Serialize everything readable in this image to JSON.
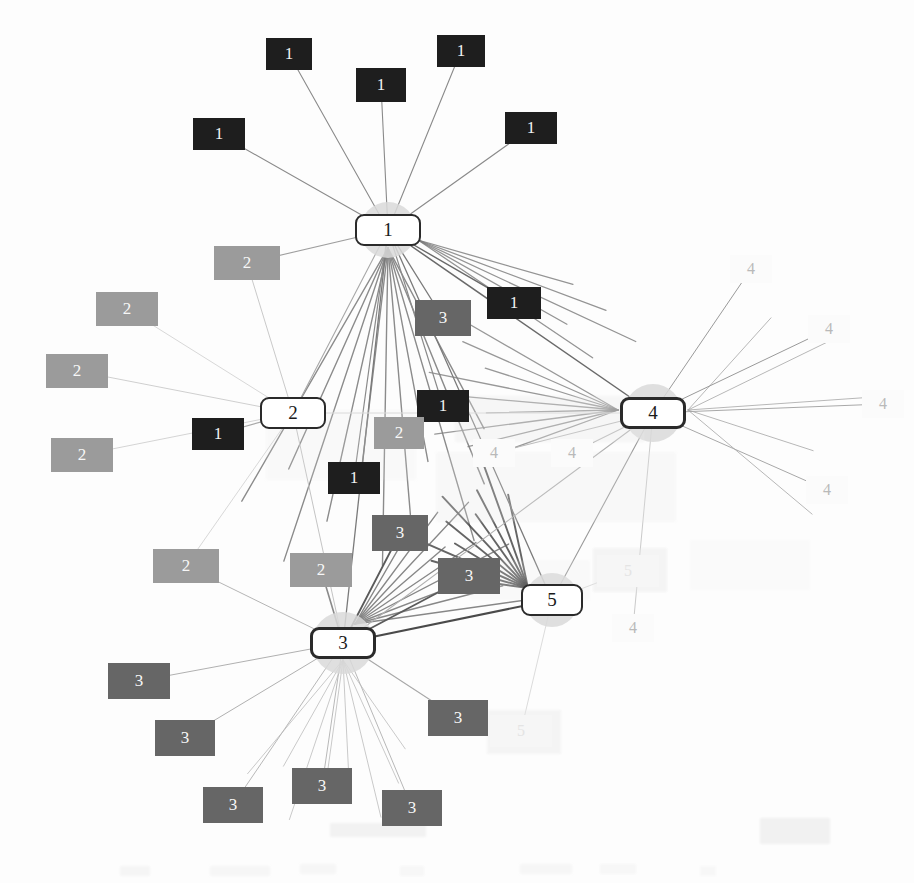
{
  "figure": {
    "type": "network-graph",
    "width": 914,
    "height": 883,
    "background": "#fdfdfd"
  },
  "legend_colors": {
    "class1": "#1e1e1e",
    "class2": "#9b9b9b",
    "class3": "#666666",
    "class4": "#fbfbfb",
    "class5": "#f6f6f6",
    "hub_fill": "#ffffff",
    "hub_border": "#2a2a2a",
    "hub_halo": "#d9d9d9",
    "edge_dark": "#3a3a3a",
    "edge_mid": "#8a8a8a",
    "edge_light": "#c9c9c9",
    "edge_faint": "#e2e2e2"
  },
  "hubs": [
    {
      "id": "hub-1",
      "label": "1",
      "x": 355,
      "y": 214,
      "w": 66,
      "h": 32,
      "halo": 56,
      "border_px": 2,
      "font_px": 19
    },
    {
      "id": "hub-2",
      "label": "2",
      "x": 260,
      "y": 397,
      "w": 66,
      "h": 32,
      "halo": 0,
      "border_px": 2,
      "font_px": 19
    },
    {
      "id": "hub-3",
      "label": "3",
      "x": 310,
      "y": 627,
      "w": 66,
      "h": 32,
      "halo": 62,
      "border_px": 3,
      "font_px": 19
    },
    {
      "id": "hub-4",
      "label": "4",
      "x": 620,
      "y": 397,
      "w": 66,
      "h": 32,
      "halo": 58,
      "border_px": 3,
      "font_px": 19
    },
    {
      "id": "hub-5",
      "label": "5",
      "x": 521,
      "y": 584,
      "w": 62,
      "h": 32,
      "halo": 54,
      "border_px": 2,
      "font_px": 19
    }
  ],
  "satellites": [
    {
      "label": "1",
      "cls": 1,
      "x": 266,
      "y": 38,
      "w": 46,
      "h": 32,
      "font_px": 17
    },
    {
      "label": "1",
      "cls": 1,
      "x": 356,
      "y": 68,
      "w": 50,
      "h": 34,
      "font_px": 17
    },
    {
      "label": "1",
      "cls": 1,
      "x": 437,
      "y": 35,
      "w": 48,
      "h": 32,
      "font_px": 17
    },
    {
      "label": "1",
      "cls": 1,
      "x": 193,
      "y": 118,
      "w": 52,
      "h": 32,
      "font_px": 17
    },
    {
      "label": "1",
      "cls": 1,
      "x": 505,
      "y": 112,
      "w": 52,
      "h": 32,
      "font_px": 17
    },
    {
      "label": "1",
      "cls": 1,
      "x": 487,
      "y": 287,
      "w": 54,
      "h": 32,
      "font_px": 17
    },
    {
      "label": "1",
      "cls": 1,
      "x": 417,
      "y": 390,
      "w": 52,
      "h": 32,
      "font_px": 17
    },
    {
      "label": "1",
      "cls": 1,
      "x": 192,
      "y": 418,
      "w": 52,
      "h": 32,
      "font_px": 17
    },
    {
      "label": "1",
      "cls": 1,
      "x": 328,
      "y": 462,
      "w": 52,
      "h": 32,
      "font_px": 17
    },
    {
      "label": "2",
      "cls": 2,
      "x": 214,
      "y": 246,
      "w": 66,
      "h": 34,
      "font_px": 17
    },
    {
      "label": "2",
      "cls": 2,
      "x": 96,
      "y": 292,
      "w": 62,
      "h": 34,
      "font_px": 17
    },
    {
      "label": "2",
      "cls": 2,
      "x": 46,
      "y": 354,
      "w": 62,
      "h": 34,
      "font_px": 17
    },
    {
      "label": "2",
      "cls": 2,
      "x": 51,
      "y": 438,
      "w": 62,
      "h": 34,
      "font_px": 17
    },
    {
      "label": "2",
      "cls": 2,
      "x": 153,
      "y": 549,
      "w": 66,
      "h": 34,
      "font_px": 17
    },
    {
      "label": "2",
      "cls": 2,
      "x": 290,
      "y": 553,
      "w": 62,
      "h": 34,
      "font_px": 17
    },
    {
      "label": "2",
      "cls": 2,
      "x": 374,
      "y": 417,
      "w": 50,
      "h": 32,
      "font_px": 17
    },
    {
      "label": "3",
      "cls": 3,
      "x": 415,
      "y": 300,
      "w": 56,
      "h": 36,
      "font_px": 17
    },
    {
      "label": "3",
      "cls": 3,
      "x": 372,
      "y": 515,
      "w": 56,
      "h": 36,
      "font_px": 17
    },
    {
      "label": "3",
      "cls": 3,
      "x": 438,
      "y": 558,
      "w": 62,
      "h": 36,
      "font_px": 17
    },
    {
      "label": "3",
      "cls": 3,
      "x": 108,
      "y": 663,
      "w": 62,
      "h": 36,
      "font_px": 17
    },
    {
      "label": "3",
      "cls": 3,
      "x": 155,
      "y": 720,
      "w": 60,
      "h": 36,
      "font_px": 17
    },
    {
      "label": "3",
      "cls": 3,
      "x": 203,
      "y": 787,
      "w": 60,
      "h": 36,
      "font_px": 17
    },
    {
      "label": "3",
      "cls": 3,
      "x": 292,
      "y": 768,
      "w": 60,
      "h": 36,
      "font_px": 17
    },
    {
      "label": "3",
      "cls": 3,
      "x": 382,
      "y": 790,
      "w": 60,
      "h": 36,
      "font_px": 17
    },
    {
      "label": "3",
      "cls": 3,
      "x": 428,
      "y": 700,
      "w": 60,
      "h": 36,
      "font_px": 17
    },
    {
      "label": "4",
      "cls": 4,
      "x": 730,
      "y": 255,
      "w": 42,
      "h": 28,
      "font_px": 16
    },
    {
      "label": "4",
      "cls": 4,
      "x": 808,
      "y": 315,
      "w": 42,
      "h": 28,
      "font_px": 16
    },
    {
      "label": "4",
      "cls": 4,
      "x": 862,
      "y": 390,
      "w": 42,
      "h": 28,
      "font_px": 16
    },
    {
      "label": "4",
      "cls": 4,
      "x": 806,
      "y": 476,
      "w": 42,
      "h": 28,
      "font_px": 16
    },
    {
      "label": "4",
      "cls": 4,
      "x": 612,
      "y": 614,
      "w": 42,
      "h": 28,
      "font_px": 16
    },
    {
      "label": "4",
      "cls": 4,
      "x": 473,
      "y": 439,
      "w": 42,
      "h": 28,
      "font_px": 16
    },
    {
      "label": "4",
      "cls": 4,
      "x": 551,
      "y": 439,
      "w": 42,
      "h": 28,
      "font_px": 16
    },
    {
      "label": "5",
      "cls": 5,
      "x": 597,
      "y": 555,
      "w": 62,
      "h": 32,
      "font_px": 16
    },
    {
      "label": "5",
      "cls": 5,
      "x": 490,
      "y": 715,
      "w": 62,
      "h": 32,
      "font_px": 16
    }
  ],
  "edges": [
    {
      "from": "sat",
      "i": 0,
      "to": "hub-1",
      "stroke": "#8a8a8a",
      "w": 1.1
    },
    {
      "from": "sat",
      "i": 1,
      "to": "hub-1",
      "stroke": "#8a8a8a",
      "w": 1.1
    },
    {
      "from": "sat",
      "i": 2,
      "to": "hub-1",
      "stroke": "#8a8a8a",
      "w": 1.1
    },
    {
      "from": "sat",
      "i": 3,
      "to": "hub-1",
      "stroke": "#8a8a8a",
      "w": 1.1
    },
    {
      "from": "sat",
      "i": 4,
      "to": "hub-1",
      "stroke": "#8a8a8a",
      "w": 1.1
    },
    {
      "from": "sat",
      "i": 5,
      "to": "hub-1",
      "stroke": "#6a6a6a",
      "w": 1.4
    },
    {
      "from": "sat",
      "i": 6,
      "to": "hub-1",
      "stroke": "#8a8a8a",
      "w": 1.2
    },
    {
      "from": "sat",
      "i": 8,
      "to": "hub-1",
      "stroke": "#8a8a8a",
      "w": 1.2
    },
    {
      "from": "sat",
      "i": 9,
      "to": "hub-1",
      "stroke": "#9e9e9e",
      "w": 1.1
    },
    {
      "from": "sat",
      "i": 16,
      "to": "hub-1",
      "stroke": "#7a7a7a",
      "w": 1.3
    },
    {
      "from": "sat",
      "i": 7,
      "to": "hub-2",
      "stroke": "#a8a8a8",
      "w": 1.1
    },
    {
      "from": "sat",
      "i": 9,
      "to": "hub-2",
      "stroke": "#c9c9c9",
      "w": 1.0
    },
    {
      "from": "sat",
      "i": 11,
      "to": "hub-2",
      "stroke": "#cfcfcf",
      "w": 1.0
    },
    {
      "from": "sat",
      "i": 12,
      "to": "hub-2",
      "stroke": "#d4d4d4",
      "w": 1.0
    },
    {
      "from": "sat",
      "i": 13,
      "to": "hub-2",
      "stroke": "#d8d8d8",
      "w": 1.0
    },
    {
      "from": "sat",
      "i": 10,
      "to": "hub-2",
      "stroke": "#d8d8d8",
      "w": 1.0
    },
    {
      "from": "sat",
      "i": 13,
      "to": "hub-3",
      "stroke": "#b5b5b5",
      "w": 1.0
    },
    {
      "from": "sat",
      "i": 14,
      "to": "hub-3",
      "stroke": "#8a8a8a",
      "w": 1.6
    },
    {
      "from": "sat",
      "i": 17,
      "to": "hub-3",
      "stroke": "#5a5a5a",
      "w": 1.8
    },
    {
      "from": "sat",
      "i": 18,
      "to": "hub-3",
      "stroke": "#5a5a5a",
      "w": 1.8
    },
    {
      "from": "sat",
      "i": 19,
      "to": "hub-3",
      "stroke": "#b0b0b0",
      "w": 1.0
    },
    {
      "from": "sat",
      "i": 20,
      "to": "hub-3",
      "stroke": "#b0b0b0",
      "w": 1.0
    },
    {
      "from": "sat",
      "i": 21,
      "to": "hub-3",
      "stroke": "#b8b8b8",
      "w": 1.0
    },
    {
      "from": "sat",
      "i": 22,
      "to": "hub-3",
      "stroke": "#b8b8b8",
      "w": 1.0
    },
    {
      "from": "sat",
      "i": 23,
      "to": "hub-3",
      "stroke": "#b8b8b8",
      "w": 1.0
    },
    {
      "from": "sat",
      "i": 24,
      "to": "hub-3",
      "stroke": "#a8a8a8",
      "w": 1.1
    },
    {
      "from": "sat",
      "i": 25,
      "to": "hub-4",
      "stroke": "#9a9a9a",
      "w": 1.0
    },
    {
      "from": "sat",
      "i": 26,
      "to": "hub-4",
      "stroke": "#9a9a9a",
      "w": 1.0
    },
    {
      "from": "sat",
      "i": 27,
      "to": "hub-4",
      "stroke": "#a8a8a8",
      "w": 1.0
    },
    {
      "from": "sat",
      "i": 28,
      "to": "hub-4",
      "stroke": "#a8a8a8",
      "w": 1.0
    },
    {
      "from": "sat",
      "i": 29,
      "to": "hub-4",
      "stroke": "#cacaca",
      "w": 1.0
    },
    {
      "from": "sat",
      "i": 30,
      "to": "hub-4",
      "stroke": "#b8b8b8",
      "w": 1.1
    },
    {
      "from": "sat",
      "i": 31,
      "to": "hub-4",
      "stroke": "#b8b8b8",
      "w": 1.1
    },
    {
      "from": "sat",
      "i": 32,
      "to": "hub-5",
      "stroke": "#dcdcdc",
      "w": 1.0
    },
    {
      "from": "sat",
      "i": 33,
      "to": "hub-5",
      "stroke": "#dcdcdc",
      "w": 1.0
    },
    {
      "from": "hub-1",
      "to": "hub-4",
      "stroke": "#6a6a6a",
      "w": 1.5
    },
    {
      "from": "hub-1",
      "to": "hub-3",
      "stroke": "#7a7a7a",
      "w": 1.3
    },
    {
      "from": "hub-1",
      "to": "hub-5",
      "stroke": "#7a7a7a",
      "w": 1.3
    },
    {
      "from": "hub-1",
      "to": "hub-2",
      "stroke": "#a8a8a8",
      "w": 1.1
    },
    {
      "from": "hub-2",
      "to": "hub-3",
      "stroke": "#c4c4c4",
      "w": 1.0
    },
    {
      "from": "hub-2",
      "to": "hub-4",
      "stroke": "#d8d8d8",
      "w": 1.0
    },
    {
      "from": "hub-3",
      "to": "hub-4",
      "stroke": "#b0b0b0",
      "w": 1.1
    },
    {
      "from": "hub-3",
      "to": "hub-5",
      "stroke": "#4a4a4a",
      "w": 2.0
    },
    {
      "from": "hub-4",
      "to": "hub-5",
      "stroke": "#9a9a9a",
      "w": 1.1
    }
  ],
  "bundle_fans": [
    {
      "name": "hub1-down-bundle",
      "ox": 388,
      "oy": 248,
      "count": 11,
      "a0": 62,
      "a1": 120,
      "len": 330,
      "stroke": "#6f6f6f",
      "w": 1.4
    },
    {
      "name": "hub1-to-hub4-bundle",
      "ox": 418,
      "oy": 240,
      "count": 5,
      "a0": 16,
      "a1": 34,
      "len": 260,
      "stroke": "#7a7a7a",
      "w": 1.3
    },
    {
      "name": "hub4-left-bundle",
      "ox": 618,
      "oy": 410,
      "count": 9,
      "a0": 160,
      "a1": 210,
      "len": 200,
      "stroke": "#7f7f7f",
      "w": 1.3
    },
    {
      "name": "hub5-upleft-bundle",
      "ox": 528,
      "oy": 588,
      "count": 10,
      "a0": 188,
      "a1": 258,
      "len": 130,
      "stroke": "#3f3f3f",
      "w": 1.9
    },
    {
      "name": "hub3-upright-bundle",
      "ox": 355,
      "oy": 624,
      "count": 9,
      "a0": 300,
      "a1": 352,
      "len": 180,
      "stroke": "#6a6a6a",
      "w": 1.4
    },
    {
      "name": "hub3-down-bundle",
      "ox": 343,
      "oy": 660,
      "count": 8,
      "a0": 55,
      "a1": 130,
      "len": 175,
      "stroke": "#bcbcbc",
      "w": 1.0
    },
    {
      "name": "hub4-right-bundle",
      "ox": 688,
      "oy": 410,
      "count": 5,
      "a0": -48,
      "a1": 40,
      "len": 200,
      "stroke": "#a6a6a6",
      "w": 1.0
    }
  ],
  "noise_blobs": [
    {
      "x": 455,
      "y": 396,
      "w": 190,
      "h": 46,
      "o": 0.3
    },
    {
      "x": 436,
      "y": 452,
      "w": 240,
      "h": 70,
      "o": 0.22
    },
    {
      "x": 266,
      "y": 410,
      "w": 150,
      "h": 70,
      "o": 0.16
    },
    {
      "x": 593,
      "y": 548,
      "w": 74,
      "h": 44,
      "o": 0.42
    },
    {
      "x": 487,
      "y": 710,
      "w": 74,
      "h": 44,
      "o": 0.4
    },
    {
      "x": 470,
      "y": 560,
      "w": 120,
      "h": 40,
      "o": 0.18
    },
    {
      "x": 690,
      "y": 540,
      "w": 120,
      "h": 50,
      "o": 0.12
    },
    {
      "x": 330,
      "y": 823,
      "w": 96,
      "h": 14,
      "o": 0.5
    },
    {
      "x": 760,
      "y": 818,
      "w": 70,
      "h": 26,
      "o": 0.55
    },
    {
      "x": 120,
      "y": 866,
      "w": 30,
      "h": 10,
      "o": 0.35
    },
    {
      "x": 210,
      "y": 866,
      "w": 60,
      "h": 10,
      "o": 0.3
    },
    {
      "x": 300,
      "y": 864,
      "w": 36,
      "h": 10,
      "o": 0.3
    },
    {
      "x": 400,
      "y": 866,
      "w": 24,
      "h": 10,
      "o": 0.28
    },
    {
      "x": 520,
      "y": 864,
      "w": 52,
      "h": 10,
      "o": 0.3
    },
    {
      "x": 600,
      "y": 864,
      "w": 36,
      "h": 10,
      "o": 0.28
    },
    {
      "x": 700,
      "y": 866,
      "w": 16,
      "h": 10,
      "o": 0.26
    }
  ]
}
